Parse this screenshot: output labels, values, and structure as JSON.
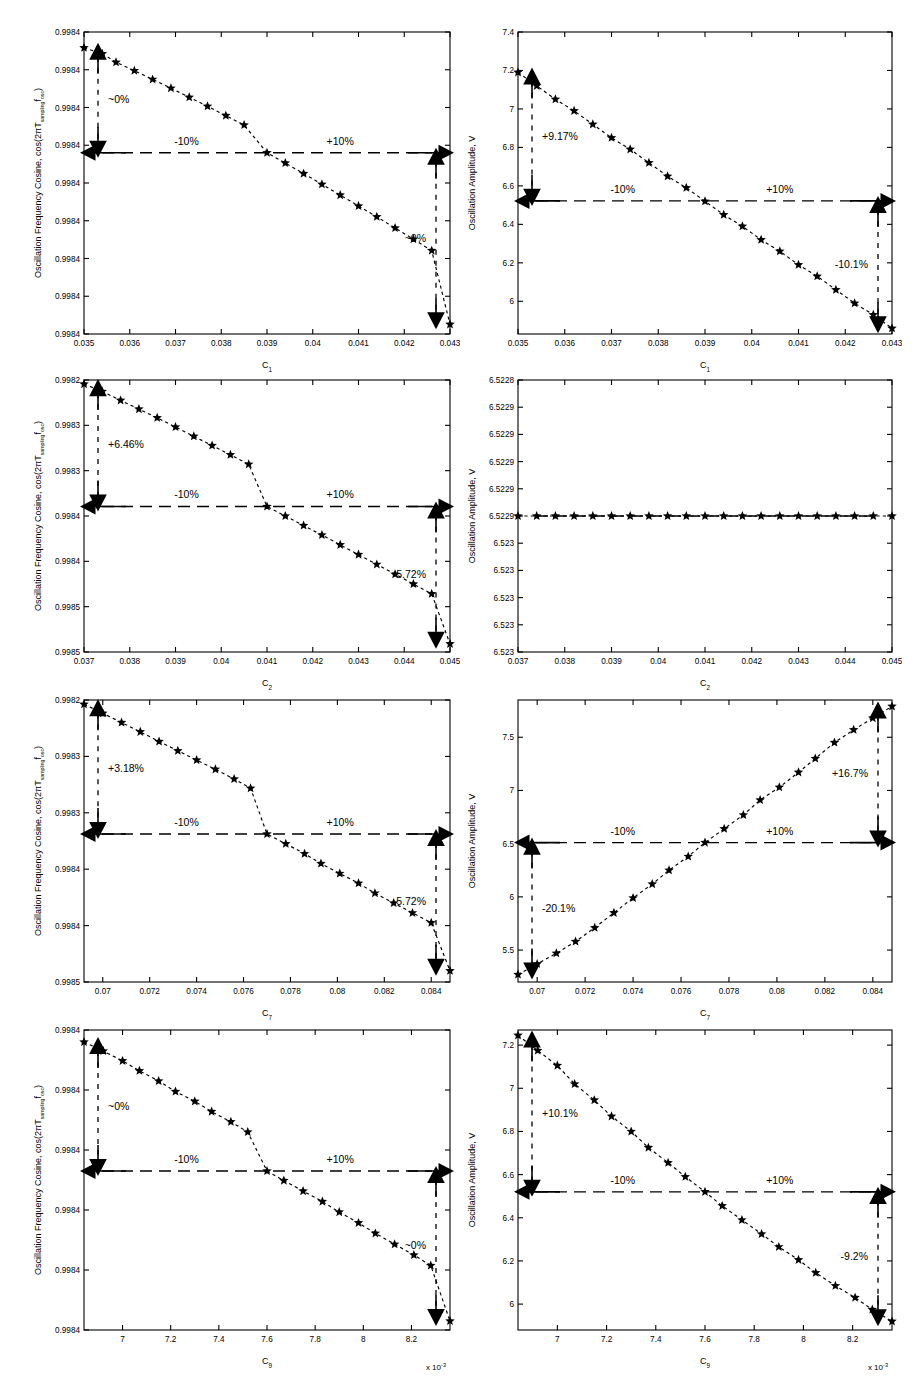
{
  "figure": {
    "title": "",
    "rows": 4,
    "cols": 2,
    "background": "#ffffff",
    "foreground": "#000000"
  },
  "labels": {
    "freq_ylabel_main": "Oscillation Frequency Cosine, cos(2πT",
    "freq_ylabel_sub1": "sampling",
    "freq_ylabel_mid": "f",
    "freq_ylabel_sub2": "osc",
    "freq_ylabel_end": ")",
    "amp_ylabel": "Oscillation Amplitude, V",
    "minus10": "-10%",
    "plus10": "+10%",
    "exponent_note": "x 10",
    "exponent_power": "-3"
  },
  "chart_data": [
    {
      "id": "panel-r1c1",
      "type": "scatter",
      "title": "",
      "xlabel": "C",
      "xlabel_sub": "1",
      "ylabel": "Oscillation Frequency Cosine, cos(2πT_sampling f_osc)",
      "xticks": [
        0.035,
        0.036,
        0.037,
        0.038,
        0.039,
        0.04,
        0.041,
        0.042,
        0.043
      ],
      "xticklabels": [
        "0.035",
        "0.036",
        "0.037",
        "0.038",
        "0.039",
        "0.04",
        "0.041",
        "0.042",
        "0.043"
      ],
      "yticklabels": [
        "0.9984",
        "0.9984",
        "0.9984",
        "0.9984",
        "0.9984",
        "0.9984",
        "0.9984",
        "0.9984",
        "0.9984"
      ],
      "xlim": [
        0.035,
        0.043
      ],
      "ylim": [
        0.0,
        1.0
      ],
      "grid": false,
      "nominal_y": 0.6,
      "x": [
        0.035,
        0.0354,
        0.0357,
        0.0361,
        0.0365,
        0.0369,
        0.0373,
        0.0377,
        0.0381,
        0.0385,
        0.039,
        0.0394,
        0.0398,
        0.0402,
        0.0406,
        0.041,
        0.0414,
        0.0418,
        0.0422,
        0.0426,
        0.043
      ],
      "y": [
        0.948,
        0.928,
        0.9,
        0.872,
        0.843,
        0.814,
        0.784,
        0.754,
        0.723,
        0.692,
        0.6,
        0.566,
        0.531,
        0.496,
        0.46,
        0.424,
        0.388,
        0.351,
        0.314,
        0.276,
        0.032
      ],
      "annotations": [
        {
          "text": "~0%",
          "side": "left",
          "value": "~0%"
        },
        {
          "text": "~0%",
          "side": "right",
          "value": "~0%"
        },
        {
          "text": "-10%",
          "side": "refline-left",
          "value": "-10%"
        },
        {
          "text": "+10%",
          "side": "refline-right",
          "value": "+10%"
        }
      ]
    },
    {
      "id": "panel-r1c2",
      "type": "scatter",
      "title": "",
      "xlabel": "C",
      "xlabel_sub": "1",
      "ylabel": "Oscillation Amplitude, V",
      "xticks": [
        0.035,
        0.036,
        0.037,
        0.038,
        0.039,
        0.04,
        0.041,
        0.042,
        0.043
      ],
      "xticklabels": [
        "0.035",
        "0.036",
        "0.037",
        "0.038",
        "0.039",
        "0.04",
        "0.041",
        "0.042",
        "0.043"
      ],
      "yticks": [
        6.0,
        6.2,
        6.4,
        6.6,
        6.8,
        7.0,
        7.2,
        7.4
      ],
      "yticklabels": [
        "6",
        "6.2",
        "6.4",
        "6.6",
        "6.8",
        "7",
        "7.2",
        "7.4"
      ],
      "xlim": [
        0.035,
        0.043
      ],
      "ylim": [
        5.83,
        7.4
      ],
      "grid": false,
      "nominal_y": 6.522,
      "x": [
        0.035,
        0.0354,
        0.0358,
        0.0362,
        0.0366,
        0.037,
        0.0374,
        0.0378,
        0.0382,
        0.0386,
        0.039,
        0.0394,
        0.0398,
        0.0402,
        0.0406,
        0.041,
        0.0414,
        0.0418,
        0.0422,
        0.0426,
        0.043
      ],
      "y": [
        7.19,
        7.12,
        7.05,
        6.99,
        6.92,
        6.85,
        6.79,
        6.72,
        6.65,
        6.59,
        6.52,
        6.45,
        6.39,
        6.32,
        6.26,
        6.19,
        6.13,
        6.06,
        5.99,
        5.93,
        5.86
      ],
      "annotations": [
        {
          "text": "+9.17%",
          "side": "left",
          "value": "+9.17%"
        },
        {
          "text": "-10.1%",
          "side": "right",
          "value": "-10.1%"
        },
        {
          "text": "-10%",
          "side": "refline-left",
          "value": "-10%"
        },
        {
          "text": "+10%",
          "side": "refline-right",
          "value": "+10%"
        }
      ]
    },
    {
      "id": "panel-r2c1",
      "type": "scatter",
      "title": "",
      "xlabel": "C",
      "xlabel_sub": "2",
      "ylabel": "Oscillation Frequency Cosine, cos(2πT_sampling f_osc)",
      "xticks": [
        0.037,
        0.038,
        0.039,
        0.04,
        0.041,
        0.042,
        0.043,
        0.044,
        0.045
      ],
      "xticklabels": [
        "0.037",
        "0.038",
        "0.039",
        "0.04",
        "0.041",
        "0.042",
        "0.043",
        "0.044",
        "0.045"
      ],
      "yticklabels": [
        "0.9985",
        "0.9985",
        "0.9984",
        "0.9984",
        "0.9983",
        "0.9983",
        "0.9982"
      ],
      "xlim": [
        0.037,
        0.045
      ],
      "ylim": [
        0.0,
        1.0
      ],
      "grid": false,
      "nominal_y": 0.535,
      "x": [
        0.037,
        0.0374,
        0.0378,
        0.0382,
        0.0386,
        0.039,
        0.0394,
        0.0398,
        0.0402,
        0.0406,
        0.041,
        0.0414,
        0.0418,
        0.0422,
        0.0426,
        0.043,
        0.0434,
        0.0438,
        0.0442,
        0.0446,
        0.045
      ],
      "y": [
        0.985,
        0.958,
        0.925,
        0.893,
        0.861,
        0.827,
        0.793,
        0.759,
        0.725,
        0.69,
        0.535,
        0.5,
        0.465,
        0.43,
        0.394,
        0.358,
        0.322,
        0.286,
        0.25,
        0.214,
        0.03
      ],
      "annotations": [
        {
          "text": "+6.46%",
          "side": "left",
          "value": "+6.46%"
        },
        {
          "text": "-5.72%",
          "side": "right",
          "value": "-5.72%"
        },
        {
          "text": "-10%",
          "side": "refline-left",
          "value": "-10%"
        },
        {
          "text": "+10%",
          "side": "refline-right",
          "value": "+10%"
        }
      ]
    },
    {
      "id": "panel-r2c2",
      "type": "scatter",
      "title": "",
      "xlabel": "C",
      "xlabel_sub": "2",
      "ylabel": "Oscillation Amplitude, V",
      "xticks": [
        0.037,
        0.038,
        0.039,
        0.04,
        0.041,
        0.042,
        0.043,
        0.044,
        0.045
      ],
      "xticklabels": [
        "0.037",
        "0.038",
        "0.039",
        "0.04",
        "0.041",
        "0.042",
        "0.043",
        "0.044",
        "0.045"
      ],
      "yticklabels": [
        "6.523",
        "6.523",
        "6.523",
        "6.523",
        "6.523",
        "6.5229",
        "6.5229",
        "6.5229",
        "6.5229",
        "6.5229",
        "6.5228"
      ],
      "xlim": [
        0.037,
        0.045
      ],
      "ylim": [
        0.0,
        1.0
      ],
      "grid": false,
      "nominal_y": 0.5,
      "x": [
        0.037,
        0.0374,
        0.0378,
        0.0382,
        0.0386,
        0.039,
        0.0394,
        0.0398,
        0.0402,
        0.0406,
        0.041,
        0.0414,
        0.0418,
        0.0422,
        0.0426,
        0.043,
        0.0434,
        0.0438,
        0.0442,
        0.0446,
        0.045
      ],
      "y": [
        0.5,
        0.5,
        0.5,
        0.5,
        0.5,
        0.5,
        0.5,
        0.5,
        0.5,
        0.5,
        0.5,
        0.5,
        0.5,
        0.5,
        0.5,
        0.5,
        0.5,
        0.5,
        0.5,
        0.5,
        0.5
      ],
      "annotations": []
    },
    {
      "id": "panel-r3c1",
      "type": "scatter",
      "title": "",
      "xlabel": "C",
      "xlabel_sub": "7",
      "ylabel": "Oscillation Frequency Cosine, cos(2πT_sampling f_osc)",
      "xticks": [
        0.07,
        0.072,
        0.074,
        0.076,
        0.078,
        0.08,
        0.082,
        0.084
      ],
      "xticklabels": [
        "0.07",
        "0.072",
        "0.074",
        "0.076",
        "0.078",
        "0.08",
        "0.082",
        "0.084"
      ],
      "yticklabels": [
        "0.9985",
        "0.9984",
        "0.9984",
        "0.9983",
        "0.9983",
        "0.9982"
      ],
      "xlim": [
        0.0692,
        0.0848
      ],
      "ylim": [
        0.0,
        1.0
      ],
      "grid": false,
      "nominal_y": 0.525,
      "x": [
        0.0692,
        0.07,
        0.0708,
        0.0716,
        0.0724,
        0.0732,
        0.074,
        0.0748,
        0.0756,
        0.0763,
        0.077,
        0.0778,
        0.0786,
        0.0793,
        0.0801,
        0.0809,
        0.0816,
        0.0824,
        0.0832,
        0.084,
        0.0848
      ],
      "y": [
        0.985,
        0.953,
        0.92,
        0.887,
        0.853,
        0.82,
        0.787,
        0.754,
        0.72,
        0.687,
        0.525,
        0.49,
        0.455,
        0.42,
        0.385,
        0.35,
        0.315,
        0.28,
        0.245,
        0.21,
        0.04
      ],
      "annotations": [
        {
          "text": "+3.18%",
          "side": "left",
          "value": "+3.18%"
        },
        {
          "text": "-5.72%",
          "side": "right",
          "value": "-5.72%"
        },
        {
          "text": "-10%",
          "side": "refline-left",
          "value": "-10%"
        },
        {
          "text": "+10%",
          "side": "refline-right",
          "value": "+10%"
        }
      ]
    },
    {
      "id": "panel-r3c2",
      "type": "scatter",
      "title": "",
      "xlabel": "C",
      "xlabel_sub": "7",
      "ylabel": "Oscillation Amplitude, V",
      "xticks": [
        0.07,
        0.072,
        0.074,
        0.076,
        0.078,
        0.08,
        0.082,
        0.084
      ],
      "xticklabels": [
        "0.07",
        "0.072",
        "0.074",
        "0.076",
        "0.078",
        "0.08",
        "0.082",
        "0.084"
      ],
      "yticks": [
        5.5,
        6.0,
        6.5,
        7.0,
        7.5
      ],
      "yticklabels": [
        "5.5",
        "6",
        "6.5",
        "7",
        "7.5"
      ],
      "xlim": [
        0.0692,
        0.0848
      ],
      "ylim": [
        5.2,
        7.85
      ],
      "grid": false,
      "nominal_y": 6.51,
      "x": [
        0.0692,
        0.07,
        0.0708,
        0.0716,
        0.0724,
        0.0732,
        0.074,
        0.0748,
        0.0755,
        0.0763,
        0.077,
        0.0778,
        0.0786,
        0.0793,
        0.0801,
        0.0809,
        0.0816,
        0.0824,
        0.0832,
        0.084,
        0.0848
      ],
      "y": [
        5.27,
        5.37,
        5.47,
        5.58,
        5.71,
        5.85,
        5.99,
        6.12,
        6.25,
        6.38,
        6.51,
        6.64,
        6.77,
        6.91,
        7.03,
        7.17,
        7.3,
        7.45,
        7.57,
        7.68,
        7.79
      ],
      "annotations": [
        {
          "text": "-20.1%",
          "side": "left",
          "value": "-20.1%"
        },
        {
          "text": "+16.7%",
          "side": "right",
          "value": "+16.7%"
        },
        {
          "text": "-10%",
          "side": "refline-left",
          "value": "-10%"
        },
        {
          "text": "+10%",
          "side": "refline-right",
          "value": "+10%"
        }
      ]
    },
    {
      "id": "panel-r4c1",
      "type": "scatter",
      "title": "",
      "xlabel": "C",
      "xlabel_sub": "9",
      "ylabel": "Oscillation Frequency Cosine, cos(2πT_sampling f_osc)",
      "xticks": [
        7.0,
        7.2,
        7.4,
        7.6,
        7.8,
        8.0,
        8.2
      ],
      "xticklabels": [
        "7",
        "7.2",
        "7.4",
        "7.6",
        "7.8",
        "8",
        "8.2"
      ],
      "yticklabels": [
        "0.9984",
        "0.9984",
        "0.9984",
        "0.9984",
        "0.9984",
        "0.9984"
      ],
      "xlim": [
        6.84,
        8.36
      ],
      "ylim": [
        0.0,
        1.0
      ],
      "grid": false,
      "nominal_y": 0.53,
      "x": [
        6.84,
        6.92,
        7.0,
        7.07,
        7.15,
        7.22,
        7.3,
        7.37,
        7.45,
        7.52,
        7.6,
        7.67,
        7.75,
        7.83,
        7.9,
        7.98,
        8.05,
        8.13,
        8.21,
        8.28,
        8.36
      ],
      "y": [
        0.96,
        0.93,
        0.897,
        0.864,
        0.83,
        0.795,
        0.762,
        0.728,
        0.694,
        0.66,
        0.53,
        0.498,
        0.463,
        0.428,
        0.393,
        0.357,
        0.322,
        0.286,
        0.25,
        0.215,
        0.03
      ],
      "annotations": [
        {
          "text": "~0%",
          "side": "left",
          "value": "~0%"
        },
        {
          "text": "~0%",
          "side": "right",
          "value": "~0%"
        },
        {
          "text": "-10%",
          "side": "refline-left",
          "value": "-10%"
        },
        {
          "text": "+10%",
          "side": "refline-right",
          "value": "+10%"
        }
      ]
    },
    {
      "id": "panel-r4c2",
      "type": "scatter",
      "title": "",
      "xlabel": "C",
      "xlabel_sub": "9",
      "ylabel": "Oscillation Amplitude, V",
      "xticks": [
        7.0,
        7.2,
        7.4,
        7.6,
        7.8,
        8.0,
        8.2
      ],
      "xticklabels": [
        "7",
        "7.2",
        "7.4",
        "7.6",
        "7.8",
        "8",
        "8.2"
      ],
      "yticks": [
        6.0,
        6.2,
        6.4,
        6.6,
        6.8,
        7.0,
        7.2
      ],
      "yticklabels": [
        "6",
        "6.2",
        "6.4",
        "6.6",
        "6.8",
        "7",
        "7.2"
      ],
      "xlim": [
        6.84,
        8.36
      ],
      "ylim": [
        5.88,
        7.27
      ],
      "grid": false,
      "nominal_y": 6.52,
      "x": [
        6.84,
        6.92,
        7.0,
        7.07,
        7.15,
        7.22,
        7.3,
        7.37,
        7.45,
        7.52,
        7.6,
        7.67,
        7.75,
        7.83,
        7.9,
        7.98,
        8.05,
        8.13,
        8.21,
        8.28,
        8.36
      ],
      "y": [
        7.245,
        7.175,
        7.105,
        7.02,
        6.945,
        6.87,
        6.8,
        6.725,
        6.655,
        6.59,
        6.52,
        6.455,
        6.39,
        6.325,
        6.265,
        6.205,
        6.145,
        6.085,
        6.03,
        5.975,
        5.92
      ],
      "annotations": [
        {
          "text": "+10.1%",
          "side": "left",
          "value": "+10.1%"
        },
        {
          "text": "-9.2%",
          "side": "right",
          "value": "-9.2%"
        },
        {
          "text": "-10%",
          "side": "refline-left",
          "value": "-10%"
        },
        {
          "text": "+10%",
          "side": "refline-right",
          "value": "+10%"
        }
      ]
    }
  ]
}
